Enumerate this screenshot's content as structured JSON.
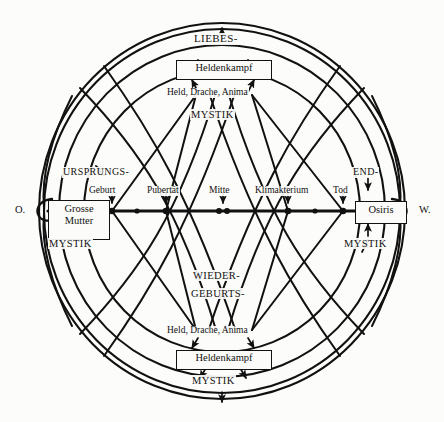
{
  "diagram": {
    "colors": {
      "ink": "#111111",
      "paper": "#fcfcfa"
    },
    "poles": {
      "east_label": "O.",
      "west_label": "W."
    },
    "axis": {
      "nodes": [
        {
          "name": "geburt",
          "label": "Geburt"
        },
        {
          "name": "pubertaet",
          "label": "Pubertät"
        },
        {
          "name": "mitte",
          "label": "Mitte"
        },
        {
          "name": "klimakterium",
          "label": "Klimakterium"
        },
        {
          "name": "tod",
          "label": "Tod"
        }
      ]
    },
    "boxes": [
      {
        "name": "heldenkampf-top",
        "label": "Heldenkampf"
      },
      {
        "name": "heldenkampf-bottom",
        "label": "Heldenkampf"
      },
      {
        "name": "grosse-mutter",
        "line1": "Grosse",
        "line2": "Mutter"
      },
      {
        "name": "osiris",
        "label": "Osiris"
      }
    ],
    "labels": {
      "liebes": "LIEBES-",
      "held_drache_anima_top": "Held, Drache, Anima",
      "mystik_top": "MYSTIK",
      "ursprungs": "URSPRUNGS-",
      "end": "END-",
      "mystik_left": "MYSTIK",
      "mystik_right": "MYSTIK",
      "wieder": "WIEDER-",
      "geburts": "GEBURTS-",
      "held_drache_anima_bottom": "Held, Drache, Anima",
      "mystik_bottom": "MYSTIK"
    }
  }
}
